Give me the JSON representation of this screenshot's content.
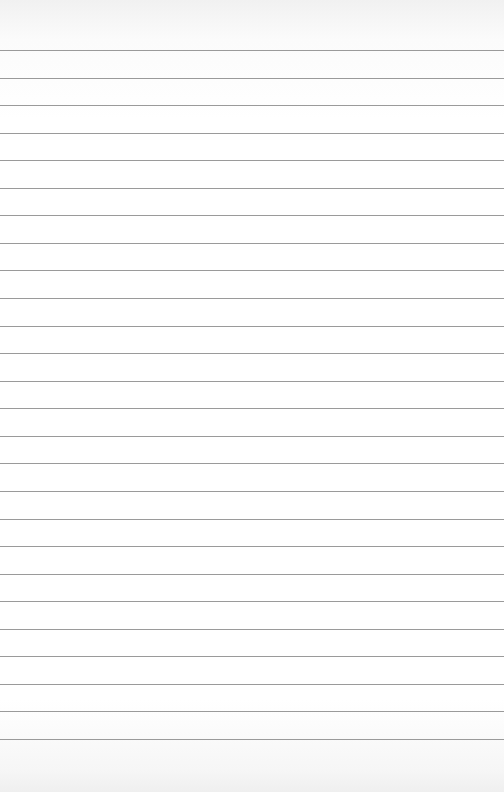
{
  "page": {
    "type": "lined-paper",
    "background_color": "#ffffff",
    "rule_color": "#9a9a9a",
    "rule_count": 26,
    "first_rule_y": 50,
    "rule_spacing": 27.56
  }
}
